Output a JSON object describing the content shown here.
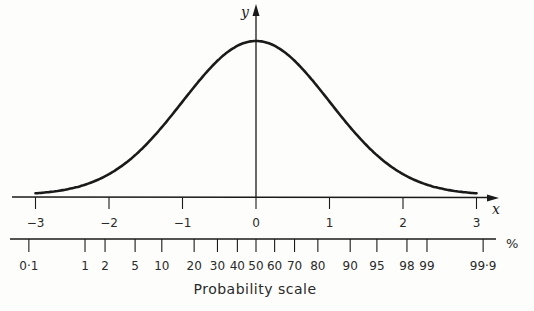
{
  "chart_data": {
    "type": "line",
    "title": "",
    "xlabel": "x",
    "ylabel": "y",
    "xlim": [
      -3,
      3
    ],
    "x_ticks": [
      -3,
      -2,
      -1,
      0,
      1,
      2,
      3
    ],
    "x_tick_labels": [
      "-3",
      "-2",
      "-1",
      "0",
      "1",
      "2",
      "3"
    ],
    "series": [
      {
        "name": "normal density",
        "function": "y = exp(-x^2/2)/sqrt(2*pi)",
        "x": [
          -3,
          -2.5,
          -2,
          -1.5,
          -1,
          -0.5,
          0,
          0.5,
          1,
          1.5,
          2,
          2.5,
          3
        ],
        "values": [
          0.0044,
          0.0175,
          0.054,
          0.1295,
          0.242,
          0.3521,
          0.3989,
          0.3521,
          0.242,
          0.1295,
          0.054,
          0.0175,
          0.0044
        ]
      }
    ],
    "probability_scale": {
      "label": "Probability scale",
      "unit": "%",
      "ticks": [
        "0·1",
        "1",
        "2",
        "5",
        "10",
        "20",
        "30",
        "40",
        "50",
        "60",
        "70",
        "80",
        "90",
        "95",
        "98",
        "99",
        "99·9"
      ],
      "tick_values": [
        0.1,
        1,
        2,
        5,
        10,
        20,
        30,
        40,
        50,
        60,
        70,
        80,
        90,
        95,
        98,
        99,
        99.9
      ]
    },
    "grid": false,
    "legend": null
  }
}
